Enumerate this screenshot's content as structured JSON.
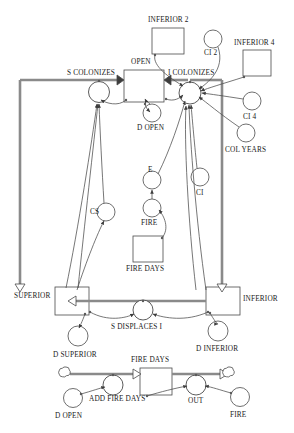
{
  "diagram": {
    "type": "system-dynamics-stock-flow",
    "colors": {
      "stroke": "#4a4a4a",
      "pipe": "#777777",
      "text": "#1a1a1a",
      "fill": "#ffffff"
    }
  },
  "stocks": [
    {
      "id": "open",
      "label": "OPEN",
      "x": 124,
      "y": 70,
      "w": 40,
      "h": 32
    },
    {
      "id": "inferior2",
      "label": "INFERIOR 2",
      "x": 152,
      "y": 28,
      "w": 32,
      "h": 26
    },
    {
      "id": "inferior4",
      "label": "INFERIOR 4",
      "x": 243,
      "y": 50,
      "w": 28,
      "h": 26
    },
    {
      "id": "firedays",
      "label": "FIRE DAYS",
      "x": 133,
      "y": 236,
      "w": 30,
      "h": 26
    },
    {
      "id": "superior",
      "label": "SUPERIOR",
      "x": 55,
      "y": 287,
      "w": 34,
      "h": 28
    },
    {
      "id": "inferior",
      "label": "INFERIOR",
      "x": 206,
      "y": 287,
      "w": 34,
      "h": 28
    },
    {
      "id": "firedays2",
      "label": "FIRE DAYS",
      "x": 140,
      "y": 368,
      "w": 32,
      "h": 27
    }
  ],
  "valves": [
    {
      "id": "s-colonizes",
      "label": "S COLONIZES",
      "cx": 99,
      "cy": 92
    },
    {
      "id": "i-colonizes",
      "label": "I COLONIZES",
      "cx": 190,
      "cy": 93
    },
    {
      "id": "s-displaces-i",
      "label": "S DISPLACES I",
      "cx": 143,
      "cy": 310
    },
    {
      "id": "add-fire-days",
      "label": "ADD FIRE DAYS",
      "cx": 113,
      "cy": 385
    },
    {
      "id": "out",
      "label": "OUT",
      "cx": 196,
      "cy": 385
    }
  ],
  "auxiliaries": [
    {
      "id": "d-open",
      "label": "D OPEN",
      "cx": 152,
      "cy": 113
    },
    {
      "id": "ci2",
      "label": "CI 2",
      "cx": 213,
      "cy": 39
    },
    {
      "id": "ci4",
      "label": "CI 4",
      "cx": 252,
      "cy": 101
    },
    {
      "id": "col-years",
      "label": "COL YEARS",
      "cx": 246,
      "cy": 133
    },
    {
      "id": "e",
      "label": "E",
      "cx": 152,
      "cy": 180
    },
    {
      "id": "ci",
      "label": "CI",
      "cx": 200,
      "cy": 177
    },
    {
      "id": "fire",
      "label": "FIRE",
      "cx": 152,
      "cy": 208
    },
    {
      "id": "cs",
      "label": "CS",
      "cx": 106,
      "cy": 212
    },
    {
      "id": "d-superior",
      "label": "D SUPERIOR",
      "cx": 78,
      "cy": 336
    },
    {
      "id": "d-inferior",
      "label": "D INFERIOR",
      "cx": 218,
      "cy": 331
    },
    {
      "id": "d-open-2",
      "label": "D OPEN",
      "cx": 73,
      "cy": 398
    },
    {
      "id": "fire-2",
      "label": "FIRE",
      "cx": 240,
      "cy": 397
    }
  ],
  "clouds": [
    {
      "id": "cloud-source",
      "cx": 64,
      "cy": 374
    },
    {
      "id": "cloud-sink",
      "cx": 228,
      "cy": 374
    }
  ],
  "labels": {
    "open": "OPEN",
    "inferior_2": "INFERIOR 2",
    "inferior_4": "INFERIOR 4",
    "ci_2": "CI 2",
    "ci_4": "CI 4",
    "col_years": "COL YEARS",
    "s_colonizes": "S COLONIZES",
    "i_colonizes": "I COLONIZES",
    "d_open": "D OPEN",
    "e": "E",
    "ci": "CI",
    "fire": "FIRE",
    "cs": "CS",
    "fire_days": "FIRE DAYS",
    "superior": "SUPERIOR",
    "inferior": "INFERIOR",
    "s_displaces_i": "S DISPLACES I",
    "d_superior": "D SUPERIOR",
    "d_inferior": "D INFERIOR",
    "fire_days_2": "FIRE DAYS",
    "add_fire_days": "ADD FIRE DAYS",
    "out": "OUT",
    "d_open_2": "D OPEN",
    "fire_2": "FIRE"
  }
}
